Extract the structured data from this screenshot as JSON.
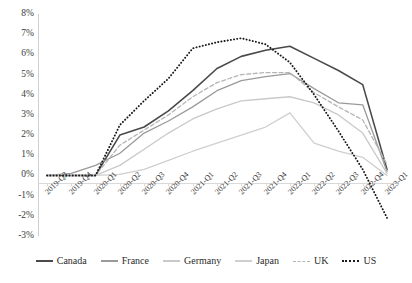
{
  "chart_data": {
    "type": "line",
    "title": "",
    "subtitle": "",
    "xlabel": "",
    "ylabel": "",
    "ylim": [
      -3,
      8
    ],
    "ytick_labels": [
      "8%",
      "7%",
      "6%",
      "5%",
      "4%",
      "3%",
      "2%",
      "1%",
      "0%",
      "-1%",
      "-2%",
      "-3%"
    ],
    "ytick_values": [
      8,
      7,
      6,
      5,
      4,
      3,
      2,
      1,
      0,
      -1,
      -2,
      -3
    ],
    "grid": false,
    "legend_position": "bottom",
    "categories": [
      "2019-Q3",
      "2019-Q4",
      "2020-Q1",
      "2020-Q2",
      "2020-Q3",
      "2020-Q4",
      "2021-Q1",
      "2021-Q2",
      "2021-Q3",
      "2021-Q4",
      "2022-Q1",
      "2022-Q2",
      "2022-Q3",
      "2022-Q4",
      "2023-Q1"
    ],
    "series": [
      {
        "name": "Canada",
        "color": "#4a4a4a",
        "style": "solid",
        "width": 1.6,
        "values": [
          0,
          0,
          0,
          2.0,
          2.4,
          3.2,
          4.2,
          5.3,
          5.9,
          6.2,
          6.4,
          5.8,
          5.2,
          4.5,
          0.3
        ]
      },
      {
        "name": "France",
        "color": "#9a9a9a",
        "style": "solid",
        "width": 1.3,
        "values": [
          0,
          0.1,
          0.5,
          1.1,
          2.1,
          2.7,
          3.4,
          4.2,
          4.7,
          4.9,
          5.05,
          4.3,
          3.6,
          3.5,
          0.2
        ]
      },
      {
        "name": "Germany",
        "color": "#c9c9c9",
        "style": "solid",
        "width": 1.3,
        "values": [
          0,
          0,
          0,
          0.5,
          1.3,
          2.1,
          2.8,
          3.3,
          3.7,
          3.8,
          3.9,
          3.6,
          3.0,
          2.1,
          0.1
        ]
      },
      {
        "name": "Japan",
        "color": "#cfcfcf",
        "style": "solid",
        "width": 1.3,
        "values": [
          0,
          0,
          0,
          0.05,
          0.3,
          0.75,
          1.2,
          1.6,
          2.0,
          2.4,
          3.1,
          1.6,
          1.2,
          0.9,
          0.0
        ]
      },
      {
        "name": "UK",
        "color": "#b5b5b5",
        "style": "dashed",
        "width": 1.3,
        "values": [
          0,
          0,
          0,
          1.5,
          2.25,
          3.0,
          3.9,
          4.6,
          5.0,
          5.1,
          5.1,
          4.1,
          3.4,
          2.75,
          0.55
        ]
      },
      {
        "name": "US",
        "color": "#1a1a1a",
        "style": "dotted",
        "width": 1.9,
        "values": [
          0,
          0,
          0,
          2.5,
          3.7,
          4.8,
          6.3,
          6.6,
          6.8,
          6.5,
          5.6,
          4.0,
          2.2,
          0.3,
          -2.1
        ]
      }
    ]
  },
  "legend": {
    "items": [
      {
        "label": "Canada"
      },
      {
        "label": "France"
      },
      {
        "label": "Germany"
      },
      {
        "label": "Japan"
      },
      {
        "label": "UK"
      },
      {
        "label": "US"
      }
    ]
  }
}
